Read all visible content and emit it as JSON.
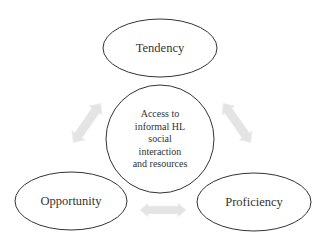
{
  "diagram": {
    "nodes": [
      {
        "id": "tendency",
        "label": "Tendency",
        "shape": "ellipse",
        "cx": 160,
        "cy": 48,
        "rx": 57,
        "ry": 29
      },
      {
        "id": "opportunity",
        "label": "Opportunity",
        "shape": "ellipse",
        "cx": 71,
        "cy": 201,
        "rx": 56,
        "ry": 29
      },
      {
        "id": "proficiency",
        "label": "Proficiency",
        "shape": "ellipse",
        "cx": 254,
        "cy": 202,
        "rx": 57,
        "ry": 29
      },
      {
        "id": "center",
        "label": "Access to informal HL social interaction and resources",
        "shape": "circle",
        "cx": 160,
        "cy": 139,
        "r": 54,
        "lines": [
          "Access to",
          "informal HL",
          "social",
          "interaction",
          "and resources"
        ]
      }
    ],
    "edges": [
      {
        "from": "opportunity",
        "to": "tendency",
        "style": "double-arrow"
      },
      {
        "from": "tendency",
        "to": "proficiency",
        "style": "double-arrow"
      },
      {
        "from": "opportunity",
        "to": "proficiency",
        "style": "double-arrow"
      }
    ],
    "colors": {
      "stroke": "#333333",
      "arrow_fill": "#e6e6e6",
      "background": "#ffffff"
    }
  }
}
